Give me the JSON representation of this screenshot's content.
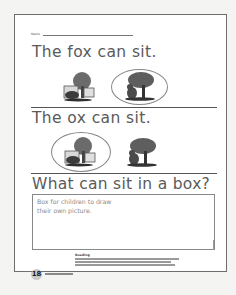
{
  "worksheet": {
    "name_label": "Name",
    "sentences": [
      "The fox can sit.",
      "The ox can sit.",
      "What can sit in a box?"
    ],
    "pictures": {
      "row1": [
        {
          "icon": "fox-in-box-icon",
          "circled": false
        },
        {
          "icon": "animal-under-tree-icon",
          "circled": true
        }
      ],
      "row2": [
        {
          "icon": "fox-in-box-icon",
          "circled": true
        },
        {
          "icon": "animal-under-tree-icon",
          "circled": false
        }
      ]
    },
    "draw_box_text_line1": "Box for children to draw",
    "draw_box_text_line2": "their own picture.",
    "teacher_note_title": "Reading",
    "page_number": "18",
    "colors": {
      "text": "#5a5a5a",
      "rule": "#555555",
      "border": "#6e6e6e",
      "page_badge": "#c9c9c9"
    }
  }
}
